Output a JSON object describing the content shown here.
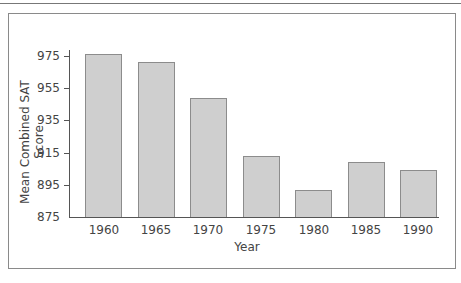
{
  "chart_data": {
    "type": "bar",
    "title": "",
    "xlabel": "Year",
    "ylabel": "Mean Combined SAT Score",
    "categories": [
      "1960",
      "1965",
      "1970",
      "1975",
      "1980",
      "1985",
      "1990"
    ],
    "values": [
      976,
      971,
      949,
      913,
      892,
      909,
      904
    ],
    "ylim": [
      875,
      980
    ],
    "yticks": [
      875,
      895,
      915,
      935,
      955,
      975
    ],
    "grid": false,
    "legend": null,
    "bar_color": "#cfcfcf",
    "bar_edge_color": "#8c8c8c"
  },
  "axis": {
    "x_title": "Year",
    "y_title": "Mean Combined SAT Score",
    "y_tick_labels": [
      "975",
      "955",
      "935",
      "915",
      "895",
      "875"
    ],
    "x_tick_labels": [
      "1960",
      "1965",
      "1970",
      "1975",
      "1980",
      "1985",
      "1990"
    ]
  }
}
